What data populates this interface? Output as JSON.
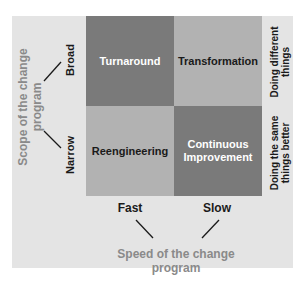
{
  "matrix": {
    "cells": [
      {
        "label": "Turnaround",
        "position": "top-left",
        "shade": "dark"
      },
      {
        "label": "Transformation",
        "position": "top-right",
        "shade": "light"
      },
      {
        "label": "Reengineering",
        "position": "bottom-left",
        "shade": "light"
      },
      {
        "label_line1": "Continuous",
        "label_line2": "Improvement",
        "position": "bottom-right",
        "shade": "dark"
      }
    ],
    "colors": {
      "dark": "#7a7a7a",
      "light": "#b2b2b2",
      "background": "#e4e4e4",
      "axis_title": "#8a8a8a"
    }
  },
  "y_axis": {
    "title_line1": "Scope of the change",
    "title_line2": "program",
    "ticks": [
      "Broad",
      "Narrow"
    ]
  },
  "x_axis": {
    "title_line1": "Speed of the change",
    "title_line2": "program",
    "ticks": [
      "Fast",
      "Slow"
    ]
  },
  "right_labels": {
    "top_line1": "Doing different",
    "top_line2": "things",
    "bottom_line1": "Doing the same",
    "bottom_line2": "things better"
  }
}
